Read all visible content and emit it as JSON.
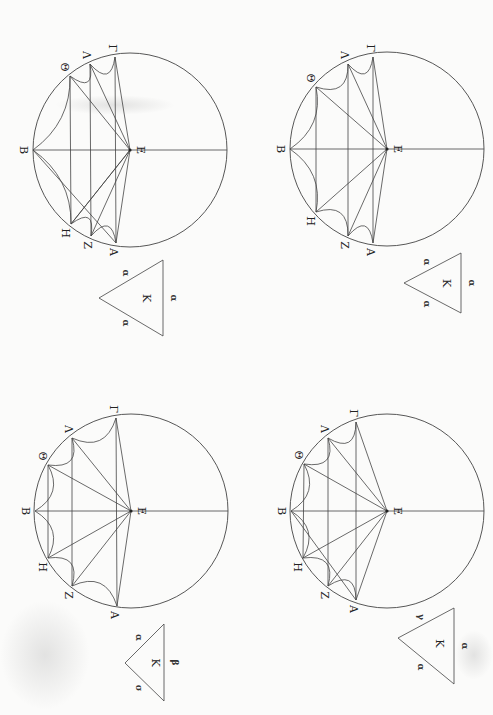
{
  "page": {
    "background": "#fbfbfa",
    "stroke_color": "#444444",
    "orientation": "rotated 90 degrees (letter B at left of each circle)"
  },
  "figures": [
    {
      "id": "top-left",
      "center": [
        130,
        150
      ],
      "radius": 97,
      "points": {
        "B": [
          33,
          150
        ],
        "Θ": [
          70,
          76
        ],
        "Λ": [
          90,
          64
        ],
        "Γ": [
          115,
          57
        ],
        "E": [
          130,
          150
        ],
        "H": [
          71,
          224
        ],
        "Z": [
          91,
          236
        ],
        "A": [
          116,
          243
        ]
      },
      "labels": {
        "B": "B",
        "Θ": "Θ",
        "Λ": "Λ",
        "Γ": "Γ",
        "E": "E",
        "H": "H",
        "Z": "Z",
        "A": "A"
      },
      "triangle": {
        "apex": [
          99,
          298
        ],
        "base_top": [
          163,
          260
        ],
        "base_bottom": [
          163,
          336
        ],
        "center_label": "K",
        "side_marks": [
          "α",
          "α",
          "α"
        ]
      }
    },
    {
      "id": "top-right",
      "center": [
        387,
        149
      ],
      "radius": 97,
      "points": {
        "B": [
          290,
          149
        ],
        "Θ": [
          316,
          87
        ],
        "Λ": [
          348,
          64
        ],
        "Γ": [
          373,
          57
        ],
        "E": [
          387,
          149
        ],
        "H": [
          316,
          212
        ],
        "Z": [
          348,
          236
        ],
        "A": [
          373,
          243
        ]
      },
      "labels": {
        "B": "B",
        "Θ": "Θ",
        "Λ": "Λ",
        "Γ": "Γ",
        "E": "E",
        "H": "H",
        "Z": "Z",
        "A": "A"
      },
      "triangle": {
        "apex": [
          404,
          283
        ],
        "base_top": [
          461,
          253
        ],
        "base_bottom": [
          461,
          313
        ],
        "center_label": "K",
        "side_marks": [
          "α",
          "α",
          "α"
        ]
      }
    },
    {
      "id": "bottom-left",
      "center": [
        131,
        511
      ],
      "radius": 97,
      "points": {
        "B": [
          35,
          511
        ],
        "Θ": [
          48,
          465
        ],
        "Λ": [
          72,
          438
        ],
        "Γ": [
          116,
          418
        ],
        "E": [
          131,
          511
        ],
        "H": [
          48,
          558
        ],
        "Z": [
          72,
          586
        ],
        "A": [
          117,
          606
        ]
      },
      "labels": {
        "B": "B",
        "Θ": "Θ",
        "Λ": "Λ",
        "Γ": "Γ",
        "E": "E",
        "H": "H",
        "Z": "Z",
        "A": "A"
      },
      "triangle": {
        "apex": [
          125,
          663
        ],
        "base_top": [
          164,
          624
        ],
        "base_bottom": [
          164,
          701
        ],
        "center_label": "K",
        "side_marks": [
          "α",
          "β",
          "σ"
        ]
      }
    },
    {
      "id": "bottom-right",
      "center": [
        387,
        511
      ],
      "radius": 97,
      "points": {
        "B": [
          291,
          511
        ],
        "Θ": [
          304,
          464
        ],
        "Λ": [
          328,
          438
        ],
        "Γ": [
          356,
          422
        ],
        "E": [
          387,
          511
        ],
        "H": [
          303,
          558
        ],
        "Z": [
          328,
          586
        ],
        "A": [
          356,
          600
        ]
      },
      "labels": {
        "B": "B",
        "Θ": "Θ",
        "Λ": "Λ",
        "Γ": "Γ",
        "E": "E",
        "H": "H",
        "Z": "Z",
        "A": "A"
      },
      "triangle": {
        "apex": [
          398,
          638
        ],
        "base_top": [
          454,
          608
        ],
        "base_bottom": [
          454,
          684
        ],
        "center_label": "K",
        "side_marks": [
          "γ",
          "α",
          "α"
        ]
      }
    }
  ]
}
